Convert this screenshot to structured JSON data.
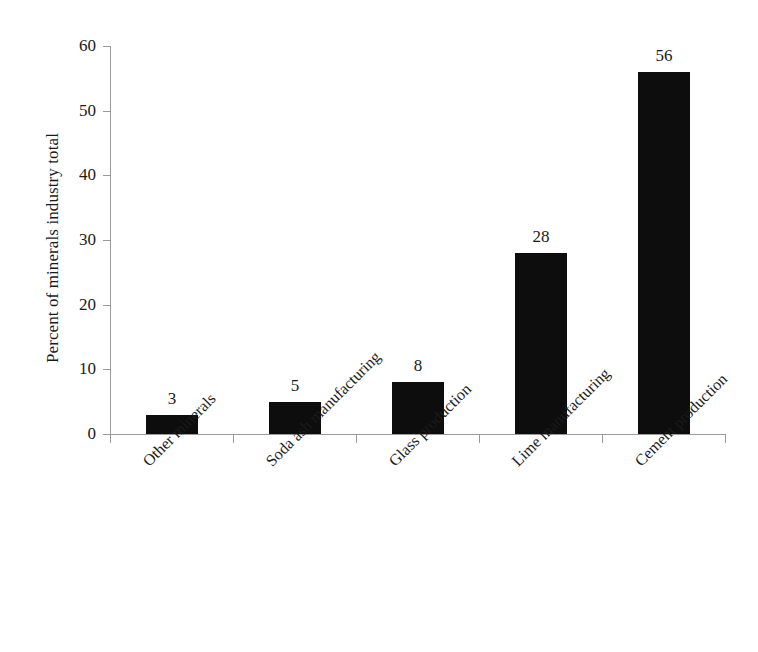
{
  "chart_data": {
    "type": "bar",
    "title": "",
    "subtitle": "",
    "xlabel": "",
    "ylabel": "Percent of minerals industry total",
    "categories": [
      "Other minerals",
      "Soda ash manufacturing",
      "Glass production",
      "Lime manufacturing",
      "Cement production"
    ],
    "values": [
      3,
      5,
      8,
      28,
      56
    ],
    "data_labels": [
      "3",
      "5",
      "8",
      "28",
      "56"
    ],
    "ylim": [
      0,
      60
    ],
    "ytick_values": [
      0,
      10,
      20,
      30,
      40,
      50,
      60
    ],
    "ytick_labels": [
      "0",
      "10",
      "20",
      "30",
      "40",
      "50",
      "60"
    ],
    "grid": false,
    "legend": false,
    "legend_position": "none",
    "bar_color": "#0d0d0d",
    "axis_color": "#9a9a9a",
    "background_color": "#ffffff",
    "xtick_label_rotation": -45
  },
  "axes": {
    "y_title": "Percent of minerals industry total"
  }
}
